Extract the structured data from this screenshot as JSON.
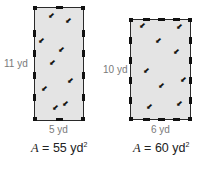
{
  "figures": [
    {
      "height_label": "11 yd",
      "width_label": "5 yd",
      "area_var": "A",
      "area_eq": " = 55 yd",
      "area_exp": "2"
    },
    {
      "height_label": "10 yd",
      "width_label": "6 yd",
      "area_var": "A",
      "area_eq": " = 60 yd",
      "area_exp": "2"
    }
  ],
  "icons": {
    "plant": "sprout-icon",
    "fence_post": "fence-post-icon"
  },
  "colors": {
    "field": "#e4e4e4",
    "fence": "#2a2a2a",
    "label": "#7a7a7a"
  }
}
